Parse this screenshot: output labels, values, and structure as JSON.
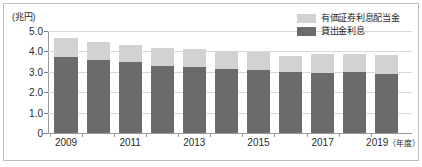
{
  "chart_data": {
    "type": "bar",
    "stacked": true,
    "title": "",
    "subtitle": "",
    "xlabel": "年度",
    "ylabel": "",
    "unit_label": "(兆円)",
    "ylim": [
      0,
      5.0
    ],
    "yticks": [
      "0",
      "1.0",
      "2.0",
      "3.0",
      "4.0",
      "5.0"
    ],
    "ytick_values": [
      0,
      1.0,
      2.0,
      3.0,
      4.0,
      5.0
    ],
    "grid": true,
    "legend_position": "top-right",
    "categories": [
      2009,
      2010,
      2011,
      2012,
      2013,
      2014,
      2015,
      2016,
      2017,
      2018,
      2019
    ],
    "xtick_labels": [
      "2009",
      "2011",
      "2013",
      "2015",
      "2017",
      "2019"
    ],
    "xtick_suffix": "（年度）",
    "series": [
      {
        "name": "貸出金利息",
        "color": "#6b6b6b",
        "values": [
          3.75,
          3.6,
          3.5,
          3.3,
          3.25,
          3.15,
          3.1,
          3.0,
          2.95,
          3.0,
          2.9
        ]
      },
      {
        "name": "有価証券利息配当金",
        "color": "#d2d2d2",
        "values": [
          0.9,
          0.85,
          0.8,
          0.85,
          0.85,
          0.85,
          0.85,
          0.8,
          0.9,
          0.85,
          0.9
        ]
      }
    ],
    "totals": [
      4.65,
      4.45,
      4.3,
      4.15,
      4.1,
      4.0,
      3.95,
      3.8,
      3.85,
      3.85,
      3.8
    ]
  },
  "legend": {
    "items": [
      {
        "label": "有価証券利息配当金",
        "color": "#d2d2d2"
      },
      {
        "label": "貸出金利息",
        "color": "#6b6b6b"
      }
    ]
  }
}
